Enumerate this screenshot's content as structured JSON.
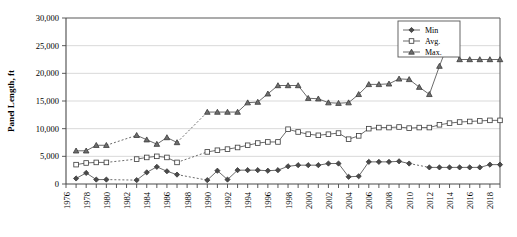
{
  "chart_data": {
    "type": "line",
    "title": "",
    "xlabel": "",
    "ylabel": "Panel Length, ft",
    "ylim": [
      0,
      30000
    ],
    "xlim": [
      1976,
      2019
    ],
    "grid": true,
    "legend_position": "top-right",
    "ytick_labels": [
      "0",
      "5,000",
      "10,000",
      "15,000",
      "20,000",
      "25,000",
      "30,000"
    ],
    "ytick_values": [
      0,
      5000,
      10000,
      15000,
      20000,
      25000,
      30000
    ],
    "xtick_labels": [
      "1976",
      "1978",
      "1980",
      "1982",
      "1984",
      "1986",
      "1988",
      "1990",
      "1992",
      "1994",
      "1996",
      "1998",
      "2000",
      "2002",
      "2004",
      "2006",
      "2008",
      "2010",
      "2012",
      "2014",
      "2016",
      "2018"
    ],
    "xtick_values": [
      1976,
      1978,
      1980,
      1982,
      1984,
      1986,
      1988,
      1990,
      1992,
      1994,
      1996,
      1998,
      2000,
      2002,
      2004,
      2006,
      2008,
      2010,
      2012,
      2014,
      2016,
      2018
    ],
    "x": [
      1977,
      1978,
      1979,
      1980,
      1981,
      1982,
      1983,
      1984,
      1985,
      1986,
      1987,
      1988,
      1989,
      1990,
      1991,
      1992,
      1993,
      1994,
      1995,
      1996,
      1997,
      1998,
      1999,
      2000,
      2001,
      2002,
      2003,
      2004,
      2005,
      2006,
      2007,
      2008,
      2009,
      2010,
      2011,
      2012,
      2013,
      2014,
      2015,
      2016,
      2017,
      2018,
      2019
    ],
    "series": [
      {
        "name": "Min",
        "marker": "filled-diamond",
        "color": "#4a4a4a",
        "values": [
          1000,
          2000,
          800,
          800,
          null,
          null,
          700,
          2100,
          3100,
          2300,
          1700,
          null,
          null,
          700,
          2400,
          800,
          2500,
          2500,
          2500,
          2400,
          2500,
          3200,
          3400,
          3400,
          3400,
          3700,
          3700,
          1300,
          1400,
          4000,
          4000,
          4000,
          4100,
          3700,
          null,
          3000,
          3000,
          3000,
          3000,
          3000,
          3000,
          3500,
          3500
        ]
      },
      {
        "name": "Avg.",
        "marker": "open-square",
        "color": "#3a3a3a",
        "values": [
          3500,
          3800,
          3900,
          3900,
          null,
          null,
          4500,
          4800,
          5000,
          4800,
          3900,
          null,
          null,
          5800,
          6100,
          6300,
          6600,
          7000,
          7400,
          7600,
          7600,
          9900,
          9400,
          9000,
          8800,
          9000,
          9200,
          8100,
          8700,
          10000,
          10200,
          10200,
          10300,
          10100,
          10200,
          10200,
          10700,
          11000,
          11200,
          11300,
          11400,
          11500,
          11500
        ]
      },
      {
        "name": "Max.",
        "marker": "filled-triangle",
        "color": "#6e6e6e",
        "values": [
          6000,
          6000,
          7000,
          7000,
          null,
          null,
          8800,
          8000,
          7200,
          8400,
          7500,
          null,
          null,
          13000,
          13000,
          13000,
          13000,
          14700,
          14800,
          16300,
          17800,
          17800,
          17800,
          15500,
          15400,
          14700,
          14600,
          14700,
          16200,
          18000,
          18000,
          18100,
          19000,
          18900,
          17500,
          16200,
          21300,
          26000,
          22500,
          22500,
          22500,
          22500,
          22500
        ]
      }
    ]
  },
  "legend": {
    "items": [
      {
        "label": "Min",
        "marker": "filled-diamond"
      },
      {
        "label": "Avg.",
        "marker": "open-square"
      },
      {
        "label": "Max.",
        "marker": "filled-triangle"
      }
    ]
  }
}
